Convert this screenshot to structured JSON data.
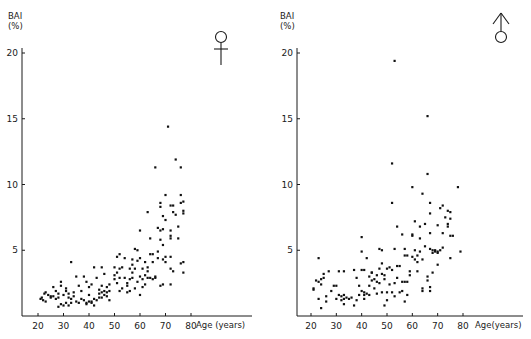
{
  "chart_data": [
    {
      "type": "scatter",
      "panel": "left",
      "symbol": "female",
      "title": "",
      "ylabel": "BAI",
      "ylabel_unit": "(%)",
      "xlabel": "Age (years)",
      "xticks": [
        20,
        30,
        40,
        50,
        60,
        70,
        80
      ],
      "yticks": [
        5,
        10,
        15,
        20
      ],
      "xlim": [
        15,
        88
      ],
      "ylim": [
        0,
        21
      ],
      "grid": false,
      "points": [
        [
          21,
          1.3
        ],
        [
          21.5,
          1.4
        ],
        [
          22,
          1.2
        ],
        [
          22.5,
          1.7
        ],
        [
          23,
          1.8
        ],
        [
          23,
          1.1
        ],
        [
          24,
          1.6
        ],
        [
          25,
          1.5
        ],
        [
          25,
          1.4
        ],
        [
          26,
          2.2
        ],
        [
          26,
          1.5
        ],
        [
          27,
          1.3
        ],
        [
          27,
          1.9
        ],
        [
          28,
          1.4
        ],
        [
          28,
          1.7
        ],
        [
          28,
          0.7
        ],
        [
          29,
          2.6
        ],
        [
          29,
          2.3
        ],
        [
          29,
          0.9
        ],
        [
          30,
          1.6
        ],
        [
          30,
          0.8
        ],
        [
          31,
          1.9
        ],
        [
          31,
          2.1
        ],
        [
          31,
          1.0
        ],
        [
          32,
          1.4
        ],
        [
          32,
          0.8
        ],
        [
          32,
          1.7
        ],
        [
          33,
          4.1
        ],
        [
          33,
          1.3
        ],
        [
          33,
          1.0
        ],
        [
          34,
          1.5
        ],
        [
          34,
          1.8
        ],
        [
          35,
          3.0
        ],
        [
          35,
          1.1
        ],
        [
          36,
          2.3
        ],
        [
          36,
          1.0
        ],
        [
          37,
          1.9
        ],
        [
          37,
          1.3
        ],
        [
          38,
          3.0
        ],
        [
          38,
          1.2
        ],
        [
          39,
          2.6
        ],
        [
          39,
          1.0
        ],
        [
          39,
          0.9
        ],
        [
          40,
          1.6
        ],
        [
          40,
          1.1
        ],
        [
          40,
          2.2
        ],
        [
          41,
          1.1
        ],
        [
          41,
          2.4
        ],
        [
          41,
          1.0
        ],
        [
          42,
          3.7
        ],
        [
          42,
          1.3
        ],
        [
          42,
          0.8
        ],
        [
          43,
          1.2
        ],
        [
          43,
          2.9
        ],
        [
          44,
          1.4
        ],
        [
          44,
          1.7
        ],
        [
          44,
          2.0
        ],
        [
          45,
          3.7
        ],
        [
          45,
          1.8
        ],
        [
          45,
          1.4
        ],
        [
          45,
          2.3
        ],
        [
          46,
          3.2
        ],
        [
          46,
          1.9
        ],
        [
          46,
          1.6
        ],
        [
          47,
          2.2
        ],
        [
          47,
          1.8
        ],
        [
          47,
          1.5
        ],
        [
          48,
          1.9
        ],
        [
          48,
          2.4
        ],
        [
          48,
          1.2
        ],
        [
          50,
          3.7
        ],
        [
          50,
          3.1
        ],
        [
          50,
          2.8
        ],
        [
          51,
          4.5
        ],
        [
          51,
          3.3
        ],
        [
          51,
          2.5
        ],
        [
          52,
          4.7
        ],
        [
          52,
          3.6
        ],
        [
          52,
          1.9
        ],
        [
          52,
          2.9
        ],
        [
          53,
          3.7
        ],
        [
          53,
          2.1
        ],
        [
          54,
          4.4
        ],
        [
          54,
          2.9
        ],
        [
          55,
          2.3
        ],
        [
          55,
          2.5
        ],
        [
          55,
          1.8
        ],
        [
          56,
          3.6
        ],
        [
          56,
          2.8
        ],
        [
          56,
          1.9
        ],
        [
          57,
          4.3
        ],
        [
          57,
          3.3
        ],
        [
          57,
          2.9
        ],
        [
          58,
          5.1
        ],
        [
          58,
          3.6
        ],
        [
          58,
          2.1
        ],
        [
          59,
          5.0
        ],
        [
          59,
          4.2
        ],
        [
          59,
          2.6
        ],
        [
          60,
          4.4
        ],
        [
          60,
          3.0
        ],
        [
          60,
          1.6
        ],
        [
          61,
          2.8
        ],
        [
          61,
          3.6
        ],
        [
          61,
          2.2
        ],
        [
          62,
          3.1
        ],
        [
          62,
          4.1
        ],
        [
          62,
          2.4
        ],
        [
          63,
          7.9
        ],
        [
          63,
          3.7
        ],
        [
          63,
          3.4
        ],
        [
          63,
          2.9
        ],
        [
          64,
          5.9
        ],
        [
          64,
          4.7
        ],
        [
          64,
          2.9
        ],
        [
          65,
          4.7
        ],
        [
          65,
          4.1
        ],
        [
          65,
          2.8
        ],
        [
          66,
          2.9
        ],
        [
          66,
          3.0
        ],
        [
          67,
          6.7
        ],
        [
          67,
          4.9
        ],
        [
          67,
          4.4
        ],
        [
          68,
          8.6
        ],
        [
          68,
          8.3
        ],
        [
          68,
          6.5
        ],
        [
          68,
          5.8
        ],
        [
          68,
          2.3
        ],
        [
          69,
          7.6
        ],
        [
          69,
          5.4
        ],
        [
          69,
          6.6
        ],
        [
          69,
          4.3
        ],
        [
          69,
          2.4
        ],
        [
          70,
          9.2
        ],
        [
          70,
          7.3
        ],
        [
          70,
          4.5
        ],
        [
          70,
          4.1
        ],
        [
          72,
          8.4
        ],
        [
          72,
          6.5
        ],
        [
          72,
          6.1
        ],
        [
          72,
          5.9
        ],
        [
          72,
          4.5
        ],
        [
          72,
          3.6
        ],
        [
          72,
          2.4
        ],
        [
          73,
          8.4
        ],
        [
          73,
          7.9
        ],
        [
          73,
          3.4
        ],
        [
          74,
          7.7
        ],
        [
          75,
          6.8
        ],
        [
          75,
          5.9
        ],
        [
          76,
          9.2
        ],
        [
          76,
          8.6
        ],
        [
          76,
          4.0
        ],
        [
          77,
          8.7
        ],
        [
          77,
          8.0
        ],
        [
          77,
          7.8
        ],
        [
          77,
          4.1
        ],
        [
          77,
          3.3
        ],
        [
          71,
          14.4
        ],
        [
          74,
          11.9
        ],
        [
          76,
          11.3
        ],
        [
          66,
          11.3
        ],
        [
          60,
          6.5
        ],
        [
          57,
          3.9
        ]
      ]
    },
    {
      "type": "scatter",
      "panel": "right",
      "symbol": "male",
      "title": "",
      "ylabel": "BAI",
      "ylabel_unit": "(%)",
      "xlabel": "Age (years)",
      "xticks": [
        20,
        30,
        40,
        50,
        60,
        70,
        80
      ],
      "yticks": [
        5,
        10,
        15,
        20
      ],
      "xlim": [
        15,
        88
      ],
      "ylim": [
        0,
        21
      ],
      "grid": false,
      "points": [
        [
          21,
          2.1
        ],
        [
          21,
          2.0
        ],
        [
          22,
          2.7
        ],
        [
          23,
          4.4
        ],
        [
          23,
          2.6
        ],
        [
          23,
          1.3
        ],
        [
          24,
          2.8
        ],
        [
          24,
          0.6
        ],
        [
          24,
          2.4
        ],
        [
          25,
          3.2
        ],
        [
          25,
          2.9
        ],
        [
          26,
          1.1
        ],
        [
          26,
          1.5
        ],
        [
          27,
          3.4
        ],
        [
          28,
          1.9
        ],
        [
          29,
          2.3
        ],
        [
          30,
          2.3
        ],
        [
          30,
          1.3
        ],
        [
          31,
          3.4
        ],
        [
          31,
          1.6
        ],
        [
          32,
          1.5
        ],
        [
          32,
          1.2
        ],
        [
          33,
          1.6
        ],
        [
          33,
          1.3
        ],
        [
          33,
          3.4
        ],
        [
          33,
          0.9
        ],
        [
          34,
          1.4
        ],
        [
          35,
          1.3
        ],
        [
          36,
          1.4
        ],
        [
          37,
          3.5
        ],
        [
          37,
          0.8
        ],
        [
          38,
          2.9
        ],
        [
          38,
          1.2
        ],
        [
          39,
          2.3
        ],
        [
          39,
          1.6
        ],
        [
          40,
          6.0
        ],
        [
          40,
          4.9
        ],
        [
          40,
          3.5
        ],
        [
          40,
          1.9
        ],
        [
          41,
          3.5
        ],
        [
          41,
          1.8
        ],
        [
          41,
          1.6
        ],
        [
          41,
          1.3
        ],
        [
          42,
          4.4
        ],
        [
          42,
          1.7
        ],
        [
          43,
          3.0
        ],
        [
          43,
          2.3
        ],
        [
          43,
          1.6
        ],
        [
          44,
          3.3
        ],
        [
          44,
          2.7
        ],
        [
          45,
          2.8
        ],
        [
          45,
          2.1
        ],
        [
          46,
          3.1
        ],
        [
          46,
          1.7
        ],
        [
          46,
          2.6
        ],
        [
          47,
          5.1
        ],
        [
          47,
          3.6
        ],
        [
          47,
          2.5
        ],
        [
          48,
          5.0
        ],
        [
          48,
          4.0
        ],
        [
          48,
          3.2
        ],
        [
          48,
          1.8
        ],
        [
          49,
          3.1
        ],
        [
          49,
          2.8
        ],
        [
          49,
          0.8
        ],
        [
          50,
          3.6
        ],
        [
          50,
          1.8
        ],
        [
          50,
          1.2
        ],
        [
          51,
          3.7
        ],
        [
          51,
          2.4
        ],
        [
          52,
          8.6
        ],
        [
          52,
          3.5
        ],
        [
          52,
          1.8
        ],
        [
          53,
          5.1
        ],
        [
          53,
          2.5
        ],
        [
          53,
          1.5
        ],
        [
          54,
          6.8
        ],
        [
          54,
          3.8
        ],
        [
          54,
          2.9
        ],
        [
          55,
          3.8
        ],
        [
          55,
          1.8
        ],
        [
          56,
          6.2
        ],
        [
          56,
          2.6
        ],
        [
          56,
          1.9
        ],
        [
          57,
          5.1
        ],
        [
          57,
          4.6
        ],
        [
          57,
          2.6
        ],
        [
          57,
          1.1
        ],
        [
          58,
          4.6
        ],
        [
          58,
          2.6
        ],
        [
          58,
          1.6
        ],
        [
          59,
          3.4
        ],
        [
          59,
          3.1
        ],
        [
          60,
          6.2
        ],
        [
          60,
          6.1
        ],
        [
          60,
          4.5
        ],
        [
          61,
          7.2
        ],
        [
          61,
          5.0
        ],
        [
          61,
          4.3
        ],
        [
          62,
          4.6
        ],
        [
          62,
          4.1
        ],
        [
          62,
          3.4
        ],
        [
          63,
          6.8
        ],
        [
          63,
          5.9
        ],
        [
          63,
          4.9
        ],
        [
          64,
          9.3
        ],
        [
          64,
          4.3
        ],
        [
          64,
          2.1
        ],
        [
          64,
          1.9
        ],
        [
          65,
          7.0
        ],
        [
          65,
          5.3
        ],
        [
          66,
          10.8
        ],
        [
          66,
          3.0
        ],
        [
          66,
          2.7
        ],
        [
          67,
          8.6
        ],
        [
          67,
          7.8
        ],
        [
          67,
          6.3
        ],
        [
          67,
          5.1
        ],
        [
          67,
          2.2
        ],
        [
          67,
          1.9
        ],
        [
          68,
          4.8
        ],
        [
          68,
          5.0
        ],
        [
          68,
          3.3
        ],
        [
          69,
          5.0
        ],
        [
          69,
          4.9
        ],
        [
          70,
          6.9
        ],
        [
          70,
          4.9
        ],
        [
          70,
          4.8
        ],
        [
          70,
          3.9
        ],
        [
          71,
          8.2
        ],
        [
          71,
          5.0
        ],
        [
          72,
          8.4
        ],
        [
          72,
          6.3
        ],
        [
          72,
          5.2
        ],
        [
          73,
          7.5
        ],
        [
          74,
          8.0
        ],
        [
          74,
          7.0
        ],
        [
          74,
          6.8
        ],
        [
          75,
          7.9
        ],
        [
          75,
          7.4
        ],
        [
          75,
          6.1
        ],
        [
          75,
          4.4
        ],
        [
          76,
          6.1
        ],
        [
          78,
          9.8
        ],
        [
          79,
          4.9
        ],
        [
          60,
          9.8
        ],
        [
          53,
          19.4
        ],
        [
          66,
          15.2
        ],
        [
          52,
          11.6
        ],
        [
          44,
          3.3
        ]
      ]
    }
  ],
  "panels": {
    "left": {
      "ylabel": "BAI",
      "ylabel_unit": "(%)",
      "xlabel": "Age (years)",
      "symbol": "female-symbol"
    },
    "right": {
      "ylabel": "BAI",
      "ylabel_unit": "(%)",
      "xlabel": "Age(years)",
      "symbol": "male-symbol"
    }
  }
}
